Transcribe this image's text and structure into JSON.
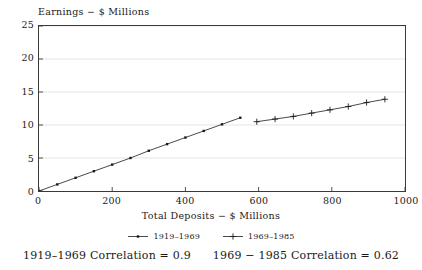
{
  "chart_data": {
    "type": "line",
    "title": "",
    "ylabel": "Earnings − $ Millions",
    "xlabel": "Total Deposits − $ Millions",
    "xlim": [
      0,
      1000
    ],
    "ylim": [
      0,
      25
    ],
    "xticks": [
      "0",
      "200",
      "400",
      "600",
      "800",
      "1000"
    ],
    "xtick_values": [
      0,
      200,
      400,
      600,
      800,
      1000
    ],
    "yticks": [
      "0",
      "5",
      "10",
      "15",
      "20",
      "25"
    ],
    "ytick_values": [
      0,
      5,
      10,
      15,
      20,
      25
    ],
    "grid": true,
    "grid_axis": "y",
    "legend_position": "bottom",
    "series": [
      {
        "name": "1919–1969",
        "marker": "dot",
        "color": "#1a1a1a",
        "points": [
          [
            0,
            0.0
          ],
          [
            50,
            1.0
          ],
          [
            100,
            2.0
          ],
          [
            150,
            3.0
          ],
          [
            200,
            4.0
          ],
          [
            250,
            5.0
          ],
          [
            300,
            6.1
          ],
          [
            350,
            7.1
          ],
          [
            400,
            8.1
          ],
          [
            450,
            9.1
          ],
          [
            500,
            10.1
          ],
          [
            550,
            11.1
          ]
        ]
      },
      {
        "name": "1969–1985",
        "marker": "plus",
        "color": "#1a1a1a",
        "points": [
          [
            595,
            10.5
          ],
          [
            645,
            10.9
          ],
          [
            695,
            11.3
          ],
          [
            745,
            11.8
          ],
          [
            795,
            12.3
          ],
          [
            845,
            12.8
          ],
          [
            895,
            13.4
          ],
          [
            945,
            13.9
          ]
        ]
      }
    ],
    "annotations": [
      "1919–1969 Correlation = 0.9",
      "1969 − 1985 Correlation = 0.62"
    ]
  },
  "legend": {
    "entries": [
      {
        "label": "1919–1969",
        "marker": "dot"
      },
      {
        "label": "1969–1985",
        "marker": "plus"
      }
    ]
  },
  "footer": {
    "correlation_left": "1919–1969 Correlation = 0.9",
    "correlation_right": "1969 − 1985 Correlation = 0.62"
  }
}
